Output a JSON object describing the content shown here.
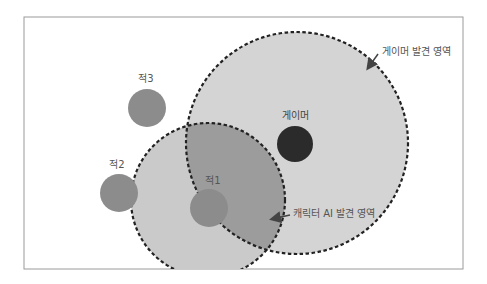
{
  "diagram": {
    "frame": {
      "x": 24,
      "y": 17,
      "width": 439,
      "height": 252,
      "border_color": "#9a9a9a"
    },
    "regions": [
      {
        "id": "player-detection-area",
        "label": "게이머 발견 영역",
        "cx": 297,
        "cy": 143,
        "r": 111,
        "fill": "#d4d4d4"
      },
      {
        "id": "ai-detection-area",
        "label": "캐릭터 AI 발견 영역",
        "cx": 208,
        "cy": 200,
        "r": 77,
        "fill": "#cacaca",
        "overlap_fill": "#9c9c9c"
      }
    ],
    "entities": [
      {
        "id": "player",
        "label": "게이머",
        "cx": 295,
        "cy": 144,
        "r": 18,
        "fill": "#2b2b2b"
      },
      {
        "id": "enemy1",
        "label": "적1",
        "cx": 209,
        "cy": 208,
        "r": 19,
        "fill": "#8c8c8c"
      },
      {
        "id": "enemy2",
        "label": "적2",
        "cx": 119,
        "cy": 193,
        "r": 19,
        "fill": "#8c8c8c"
      },
      {
        "id": "enemy3",
        "label": "적3",
        "cx": 147,
        "cy": 108,
        "r": 19,
        "fill": "#8c8c8c"
      }
    ],
    "callouts": {
      "player_area": "게이머 발견 영역",
      "ai_area": "캐릭터 AI 발견 영역"
    }
  }
}
